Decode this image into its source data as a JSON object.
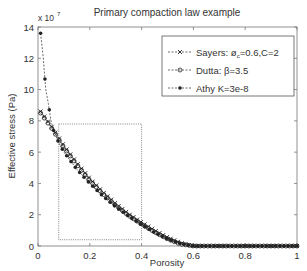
{
  "chart_data": {
    "type": "line",
    "title": "Primary compaction law example",
    "xlabel": "Porosity",
    "ylabel": "Effective stress (Pa)",
    "y_scale_label": "x 10",
    "y_scale_exponent": "7",
    "xlim": [
      0,
      1
    ],
    "ylim": [
      0,
      14
    ],
    "xticks": [
      "0",
      "0.2",
      "0.4",
      "0.6",
      "0.8",
      "1"
    ],
    "xtick_values": [
      0,
      0.2,
      0.4,
      0.6,
      0.8,
      1
    ],
    "yticks": [
      "0",
      "2",
      "4",
      "6",
      "8",
      "10",
      "12",
      "14"
    ],
    "ytick_values": [
      0,
      2,
      4,
      6,
      8,
      10,
      12,
      14
    ],
    "grid": false,
    "legend_position": "upper right",
    "legend": [
      {
        "label": "Sayers: ø",
        "sub": "c",
        "label_rest": "=0.6,C=2",
        "marker": "x"
      },
      {
        "label": "Dutta: β=3.5",
        "sub": "",
        "label_rest": "",
        "marker": "o"
      },
      {
        "label": "Athy K=3e-8",
        "sub": "",
        "label_rest": "",
        "marker": "*"
      }
    ],
    "series": [
      {
        "name": "Sayers: øc=0.6,C=2",
        "marker": "x",
        "x": [
          0.01,
          0.05,
          0.1,
          0.15,
          0.2,
          0.25,
          0.3,
          0.35,
          0.4,
          0.45,
          0.5,
          0.55,
          0.6,
          0.7,
          0.8,
          0.9,
          1.0
        ],
        "y": [
          8.6,
          7.7,
          6.4,
          5.3,
          4.3,
          3.45,
          2.7,
          2.05,
          1.5,
          1.0,
          0.55,
          0.2,
          0,
          0,
          0,
          0,
          0
        ]
      },
      {
        "name": "Dutta: β=3.5",
        "marker": "o",
        "x": [
          0.01,
          0.05,
          0.1,
          0.15,
          0.2,
          0.25,
          0.3,
          0.35,
          0.4,
          0.45,
          0.5,
          0.55,
          0.6,
          0.7,
          0.8,
          0.9,
          1.0
        ],
        "y": [
          8.5,
          7.6,
          6.3,
          5.2,
          4.2,
          3.35,
          2.6,
          1.95,
          1.4,
          0.9,
          0.45,
          0.12,
          0,
          0,
          0,
          0,
          0
        ]
      },
      {
        "name": "Athy K=3e-8",
        "marker": "*",
        "x": [
          0.01,
          0.02,
          0.03,
          0.04,
          0.05,
          0.06,
          0.08,
          0.1,
          0.15,
          0.2,
          0.25,
          0.3,
          0.35,
          0.4,
          0.45,
          0.5,
          0.55,
          0.6,
          0.7,
          0.8,
          0.9,
          1.0
        ],
        "y": [
          13.6,
          12.1,
          10.0,
          9.1,
          8.0,
          7.4,
          6.6,
          6.0,
          4.9,
          4.0,
          3.2,
          2.5,
          1.9,
          1.35,
          0.85,
          0.45,
          0.15,
          0,
          0,
          0,
          0,
          0
        ]
      }
    ],
    "annotations": [
      {
        "type": "dotted-rectangle",
        "x0": 0.08,
        "x1": 0.4,
        "y0": 0.4,
        "y1": 7.8
      }
    ]
  }
}
